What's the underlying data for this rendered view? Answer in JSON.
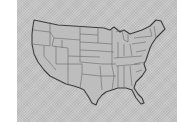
{
  "image": {
    "description": "Grayscale map of the contiguous United States with state borders",
    "icon": "us-map-icon",
    "colors": {
      "background": "#ffffff",
      "frame": "#c4c4c4",
      "land": "#bdbdbd",
      "border": "#6a6a6a",
      "outline": "#3c3c3c"
    }
  }
}
